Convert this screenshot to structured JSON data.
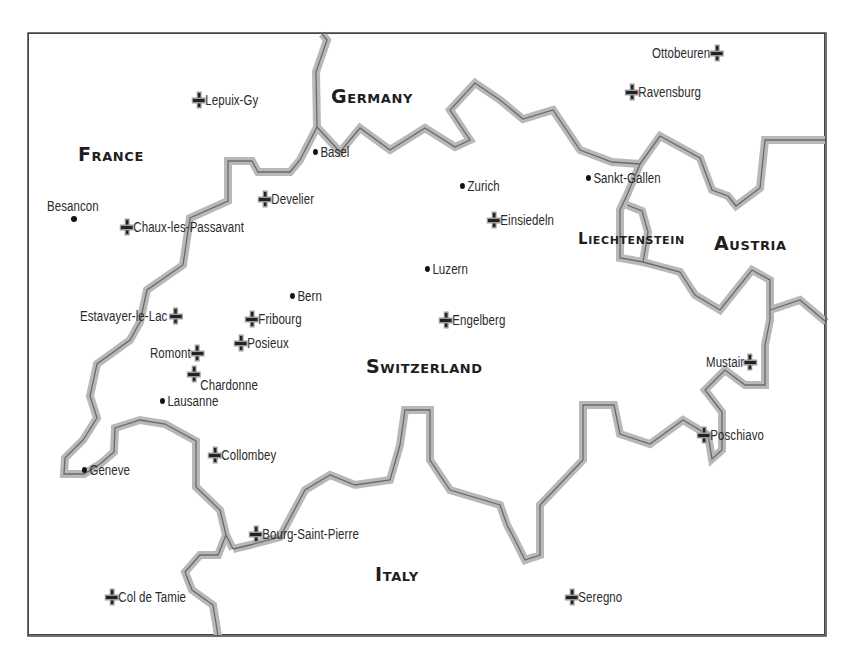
{
  "map": {
    "frame": {
      "left": 28,
      "top": 33,
      "right": 826,
      "bottom": 636
    },
    "colors": {
      "border_halo": "#b8b8b8",
      "border_core": "#6a6a6a",
      "frame": "#444444",
      "text": "#2a2a2a"
    },
    "countries": [
      {
        "id": "france",
        "label": "France",
        "x": 78,
        "y": 145,
        "size": "big"
      },
      {
        "id": "germany",
        "label": "Germany",
        "x": 331,
        "y": 87,
        "size": "big"
      },
      {
        "id": "switzerland",
        "label": "Switzerland",
        "x": 366,
        "y": 357,
        "size": "big"
      },
      {
        "id": "liechtenstein",
        "label": "Liechtenstein",
        "x": 578,
        "y": 231,
        "size": "small"
      },
      {
        "id": "austria",
        "label": "Austria",
        "x": 714,
        "y": 234,
        "size": "big"
      },
      {
        "id": "italy",
        "label": "Italy",
        "x": 375,
        "y": 565,
        "size": "big"
      }
    ],
    "cities": [
      {
        "label": "Basel",
        "x": 313,
        "y": 154
      },
      {
        "label": "Besancon",
        "x": 47,
        "y": 209,
        "label_above": true
      },
      {
        "label": "Zurich",
        "x": 460,
        "y": 188
      },
      {
        "label": "Sankt-Gallen",
        "x": 586,
        "y": 180
      },
      {
        "label": "Luzern",
        "x": 425,
        "y": 271
      },
      {
        "label": "Bern",
        "x": 290,
        "y": 298
      },
      {
        "label": "Lausanne",
        "x": 160,
        "y": 403
      },
      {
        "label": "Geneve",
        "x": 82,
        "y": 472
      }
    ],
    "monasteries": [
      {
        "label": "Lepuix-Gy",
        "x": 193,
        "y": 102
      },
      {
        "label": "Ottobeuren",
        "x": 652,
        "y": 55,
        "align": "right"
      },
      {
        "label": "Ravensburg",
        "x": 626,
        "y": 94
      },
      {
        "label": "Develier",
        "x": 259,
        "y": 201
      },
      {
        "label": "Chaux-les-Passavant",
        "x": 121,
        "y": 229
      },
      {
        "label": "Einsiedeln",
        "x": 488,
        "y": 222
      },
      {
        "label": "Estavayer-le-Lac",
        "x": 80,
        "y": 318,
        "align": "right"
      },
      {
        "label": "Fribourg",
        "x": 246,
        "y": 321
      },
      {
        "label": "Engelberg",
        "x": 440,
        "y": 322
      },
      {
        "label": "Posieux",
        "x": 235,
        "y": 345
      },
      {
        "label": "Romont",
        "x": 150,
        "y": 355,
        "align": "right"
      },
      {
        "label": "Chardonne",
        "x": 188,
        "y": 377
      },
      {
        "label": "Mustair",
        "x": 706,
        "y": 364,
        "align": "right"
      },
      {
        "label": "Collombey",
        "x": 209,
        "y": 457
      },
      {
        "label": "Poschiavo",
        "x": 698,
        "y": 437
      },
      {
        "label": "Bourg-Saint-Pierre",
        "x": 250,
        "y": 536
      },
      {
        "label": "Col de Tamie",
        "x": 106,
        "y": 599
      },
      {
        "label": "Seregno",
        "x": 566,
        "y": 599
      }
    ]
  }
}
